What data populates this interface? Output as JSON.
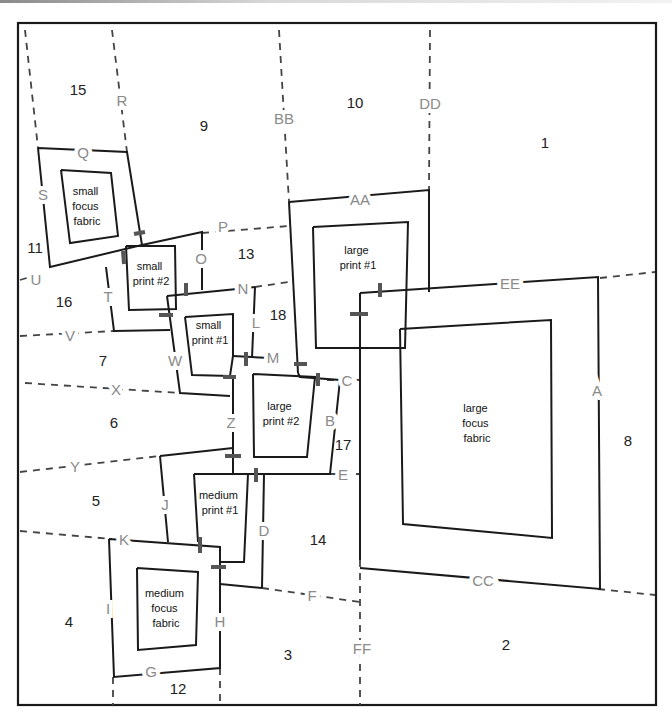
{
  "diagram": {
    "type": "quilt-block-piecing-map",
    "region_numbers": {
      "r1": "1",
      "r2": "2",
      "r3": "3",
      "r4": "4",
      "r5": "5",
      "r6": "6",
      "r7": "7",
      "r8": "8",
      "r9": "9",
      "r10": "10",
      "r11": "11",
      "r12": "12",
      "r13": "13",
      "r14": "14",
      "r15": "15",
      "r16": "16",
      "r17": "17",
      "r18": "18"
    },
    "segment_labels": {
      "A": "A",
      "B": "B",
      "C": "C",
      "D": "D",
      "E": "E",
      "F": "F",
      "G": "G",
      "H": "H",
      "I": "I",
      "J": "J",
      "K": "K",
      "L": "L",
      "M": "M",
      "N": "N",
      "O": "O",
      "P": "P",
      "Q": "Q",
      "R": "R",
      "S": "S",
      "T": "T",
      "U": "U",
      "V": "V",
      "W": "W",
      "X": "X",
      "Y": "Y",
      "Z": "Z",
      "AA": "AA",
      "BB": "BB",
      "CC": "CC",
      "DD": "DD",
      "EE": "EE",
      "FF": "FF"
    },
    "fabric_blocks": {
      "small_focus": [
        "small",
        "focus",
        "fabric"
      ],
      "small_print_2": [
        "small",
        "print #2"
      ],
      "small_print_1": [
        "small",
        "print #1"
      ],
      "large_print_1": [
        "large",
        "print #1"
      ],
      "large_print_2": [
        "large",
        "print #2"
      ],
      "large_focus": [
        "large",
        "focus",
        "fabric"
      ],
      "medium_print_1": [
        "medium",
        "print #1"
      ],
      "medium_focus": [
        "medium",
        "focus",
        "fabric"
      ]
    }
  }
}
